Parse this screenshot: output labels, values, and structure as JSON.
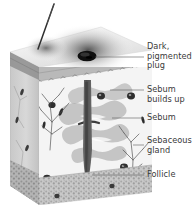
{
  "figure": {
    "background_color": "#ffffff",
    "text_color": "#3a3a3a",
    "leader_line_color": "#555555"
  },
  "labels": [
    {
      "id": "plug",
      "text": "Dark,\npigmented\nplug",
      "target": "dark-pigmented-plug"
    },
    {
      "id": "builds",
      "text": "Sebum\nbuilds up",
      "target": "sebum-buildup-region"
    },
    {
      "id": "sebum",
      "text": "Sebum",
      "target": "sebum-region"
    },
    {
      "id": "gland",
      "text": "Sebaceous\ngland",
      "target": "sebaceous-gland"
    },
    {
      "id": "foll",
      "text": "Follicle",
      "target": "follicle"
    }
  ],
  "anatomy": {
    "hair_shaft": "hair-shaft",
    "epidermis": "epidermis-layer",
    "dermis": "dermis-layer",
    "subcutaneous": "subcutaneous-layer",
    "plug_color": "#1a1a1a",
    "skin_surface_color": "#e8e8e8",
    "dermis_color": "#f2f2f2"
  }
}
